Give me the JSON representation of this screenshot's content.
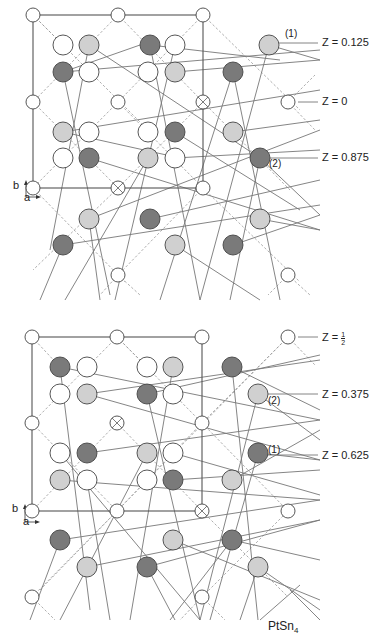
{
  "title": "PtSn4",
  "formula": {
    "base": "PtSn",
    "sub": "4"
  },
  "colors": {
    "white_atom": "#ffffff",
    "light_atom": "#d0d0d0",
    "dark_atom": "#7a7a7a",
    "outline": "#444444",
    "bond": "#777777",
    "dashed": "#999999"
  },
  "top_panel": {
    "axis": {
      "b": "b",
      "a": "a"
    },
    "levels": [
      {
        "label": "Z = 0.125",
        "site": "(1)"
      },
      {
        "label": "Z = 0",
        "site": ""
      },
      {
        "label": "Z = 0.875",
        "site": "(2)"
      }
    ]
  },
  "bottom_panel": {
    "axis": {
      "b": "b",
      "a": "a"
    },
    "levels": [
      {
        "label_prefix": "Z =",
        "frac_num": "1",
        "frac_den": "2",
        "site": ""
      },
      {
        "label": "Z = 0.375",
        "site": "(2)"
      },
      {
        "label": "Z = 0.625",
        "site": "(1)"
      }
    ]
  },
  "legend": {
    "white": "Pt / small sites",
    "light": "Sn (upper level)",
    "dark": "Sn (lower level)"
  }
}
